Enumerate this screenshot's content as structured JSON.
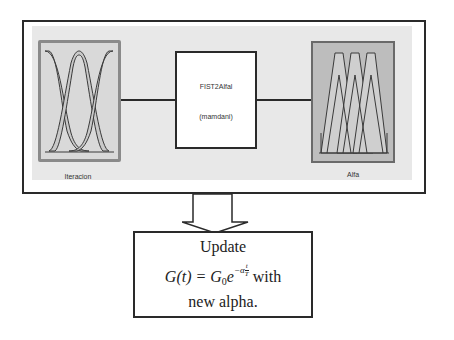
{
  "fis_diagram": {
    "input": {
      "label": "Iteracion",
      "panel_type": "interval type-2 gaussian membership functions",
      "mf_count": 3
    },
    "system": {
      "name": "FIST2Alfal",
      "type": "(mamdani)"
    },
    "output": {
      "label": "Alfa",
      "panel_type": "interval type-2 triangular membership functions",
      "mf_count": 3
    }
  },
  "update_step": {
    "title": "Update",
    "formula_lhs": "G(t) = G",
    "formula_sub": "0",
    "formula_base": "e",
    "formula_exp_prefix": "−α",
    "formula_exp_num": "t",
    "formula_exp_den": "T",
    "formula_suffix": " with",
    "tail": "new alpha."
  },
  "colors": {
    "border": "#2a2a2a",
    "frame_fill": "#e8e8e8",
    "left_panel_fill": "#d9d9d9",
    "right_panel_fill": "#bdbdbd",
    "mf_band_fill": "#c8c8c8"
  }
}
